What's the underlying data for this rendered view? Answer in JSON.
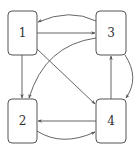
{
  "diagram": {
    "type": "directed-graph",
    "nodes": [
      {
        "id": "1",
        "label": "1"
      },
      {
        "id": "2",
        "label": "2"
      },
      {
        "id": "3",
        "label": "3"
      },
      {
        "id": "4",
        "label": "4"
      }
    ],
    "edges": [
      {
        "from": "1",
        "to": "3",
        "style": "straight"
      },
      {
        "from": "3",
        "to": "1",
        "style": "curved"
      },
      {
        "from": "1",
        "to": "2",
        "style": "straight"
      },
      {
        "from": "3",
        "to": "2",
        "style": "curved"
      },
      {
        "from": "1",
        "to": "4",
        "style": "straight"
      },
      {
        "from": "4",
        "to": "3",
        "style": "straight"
      },
      {
        "from": "3",
        "to": "4",
        "style": "curved"
      },
      {
        "from": "4",
        "to": "2",
        "style": "straight"
      },
      {
        "from": "2",
        "to": "4",
        "style": "curved"
      }
    ],
    "colors": {
      "stroke": "#555555",
      "label": "#333333",
      "background": "#ffffff"
    }
  }
}
